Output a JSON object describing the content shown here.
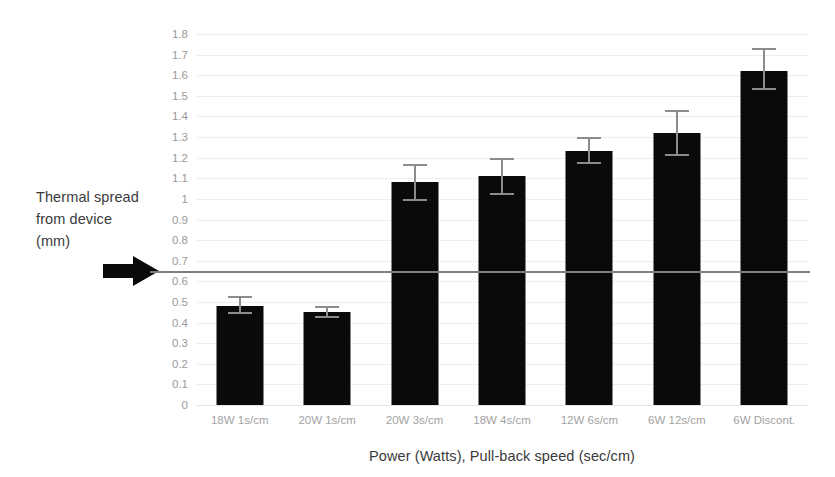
{
  "chart_data": {
    "type": "bar",
    "title": "",
    "xlabel": "Power (Watts), Pull-back speed (sec/cm)",
    "ylabel": "Thermal spread from device (mm)",
    "ylabel_lines": [
      "Thermal spread",
      "from device",
      "(mm)"
    ],
    "categories": [
      "18W 1s/cm",
      "20W 1s/cm",
      "20W 3s/cm",
      "18W 4s/cm",
      "12W 6s/cm",
      "6W 12s/cm",
      "6W Discont."
    ],
    "values": [
      0.48,
      0.45,
      1.08,
      1.11,
      1.23,
      1.32,
      1.62
    ],
    "error_low": [
      0.44,
      0.42,
      0.99,
      1.02,
      1.17,
      1.21,
      1.53
    ],
    "error_high": [
      0.53,
      0.48,
      1.17,
      1.2,
      1.3,
      1.43,
      1.73
    ],
    "ylim": [
      0,
      1.8
    ],
    "ytick_labels": [
      "0",
      "0.1",
      "0.2",
      "0.3",
      "0.4",
      "0.5",
      "0.6",
      "0.7",
      "0.8",
      "0.9",
      "1",
      "1.1",
      "1.2",
      "1.3",
      "1.4",
      "1.5",
      "1.6",
      "1.7",
      "1.8"
    ],
    "ytick_values": [
      0,
      0.1,
      0.2,
      0.3,
      0.4,
      0.5,
      0.6,
      0.7,
      0.8,
      0.9,
      1.0,
      1.1,
      1.2,
      1.3,
      1.4,
      1.5,
      1.6,
      1.7,
      1.8
    ],
    "grid": true,
    "legend": "none",
    "bar_color": "#0a0a0a",
    "error_bar_color": "#8c8c8c",
    "gridline_color": "#eceff1",
    "annotations": [
      {
        "name": "threshold-reference-line",
        "value": 0.65,
        "color": "#7f7f7f",
        "marker": "black-right-arrow"
      }
    ]
  }
}
